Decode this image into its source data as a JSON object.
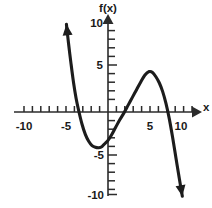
{
  "chart_data": {
    "type": "line",
    "title": "",
    "xlabel": "x",
    "ylabel": "f(x)",
    "xlim": [
      -10.5,
      10.5
    ],
    "ylim": [
      -10.5,
      10.5
    ],
    "grid": false,
    "legend": null,
    "x_tick_labels": [
      "-10",
      "-5",
      "5",
      "10"
    ],
    "x_tick_values": [
      -10,
      -5,
      5,
      10
    ],
    "y_tick_labels": [
      "10",
      "5",
      "-5",
      "-10"
    ],
    "y_tick_values": [
      10,
      5,
      -5,
      -10
    ],
    "x_tick_interval": 1,
    "y_tick_interval": 1,
    "series": [
      {
        "name": "f(x)",
        "style": "solid-thick-hand-drawn",
        "color": "#1c1c1c",
        "start_arrow": "up",
        "end_arrow": "down",
        "x": [
          -4.95,
          -4.7,
          -4.4,
          -4.1,
          -3.8,
          -3.5,
          -3.1,
          -2.7,
          -2.3,
          -1.9,
          -1.5,
          -1.1,
          -0.7,
          -0.3,
          0.0,
          0.4,
          0.9,
          1.4,
          1.9,
          2.4,
          2.9,
          3.4,
          3.9,
          4.4,
          4.9,
          5.3,
          5.7,
          6.1,
          6.5,
          6.9,
          7.3,
          7.7,
          8.1,
          8.5,
          8.85
        ],
        "y": [
          10.2,
          8.0,
          5.6,
          3.4,
          1.6,
          0.2,
          -1.4,
          -2.6,
          -3.4,
          -3.9,
          -4.1,
          -4.15,
          -4.0,
          -3.6,
          -3.3,
          -2.7,
          -1.8,
          -0.9,
          -0.1,
          0.8,
          1.7,
          2.6,
          3.5,
          4.3,
          4.7,
          4.6,
          4.1,
          3.4,
          2.4,
          1.0,
          -0.8,
          -3.0,
          -5.4,
          -7.8,
          -9.8
        ]
      }
    ],
    "annotations": {
      "x_intercepts": [
        -3.55,
        2.0,
        7.05
      ],
      "y_intercept": -3.3,
      "local_minimum": {
        "x": -1.1,
        "y": -4.15
      },
      "local_maximum": {
        "x": 4.95,
        "y": 4.72
      }
    }
  },
  "axes": {
    "x_axis_label": "x",
    "y_axis_label": "f(x)"
  }
}
